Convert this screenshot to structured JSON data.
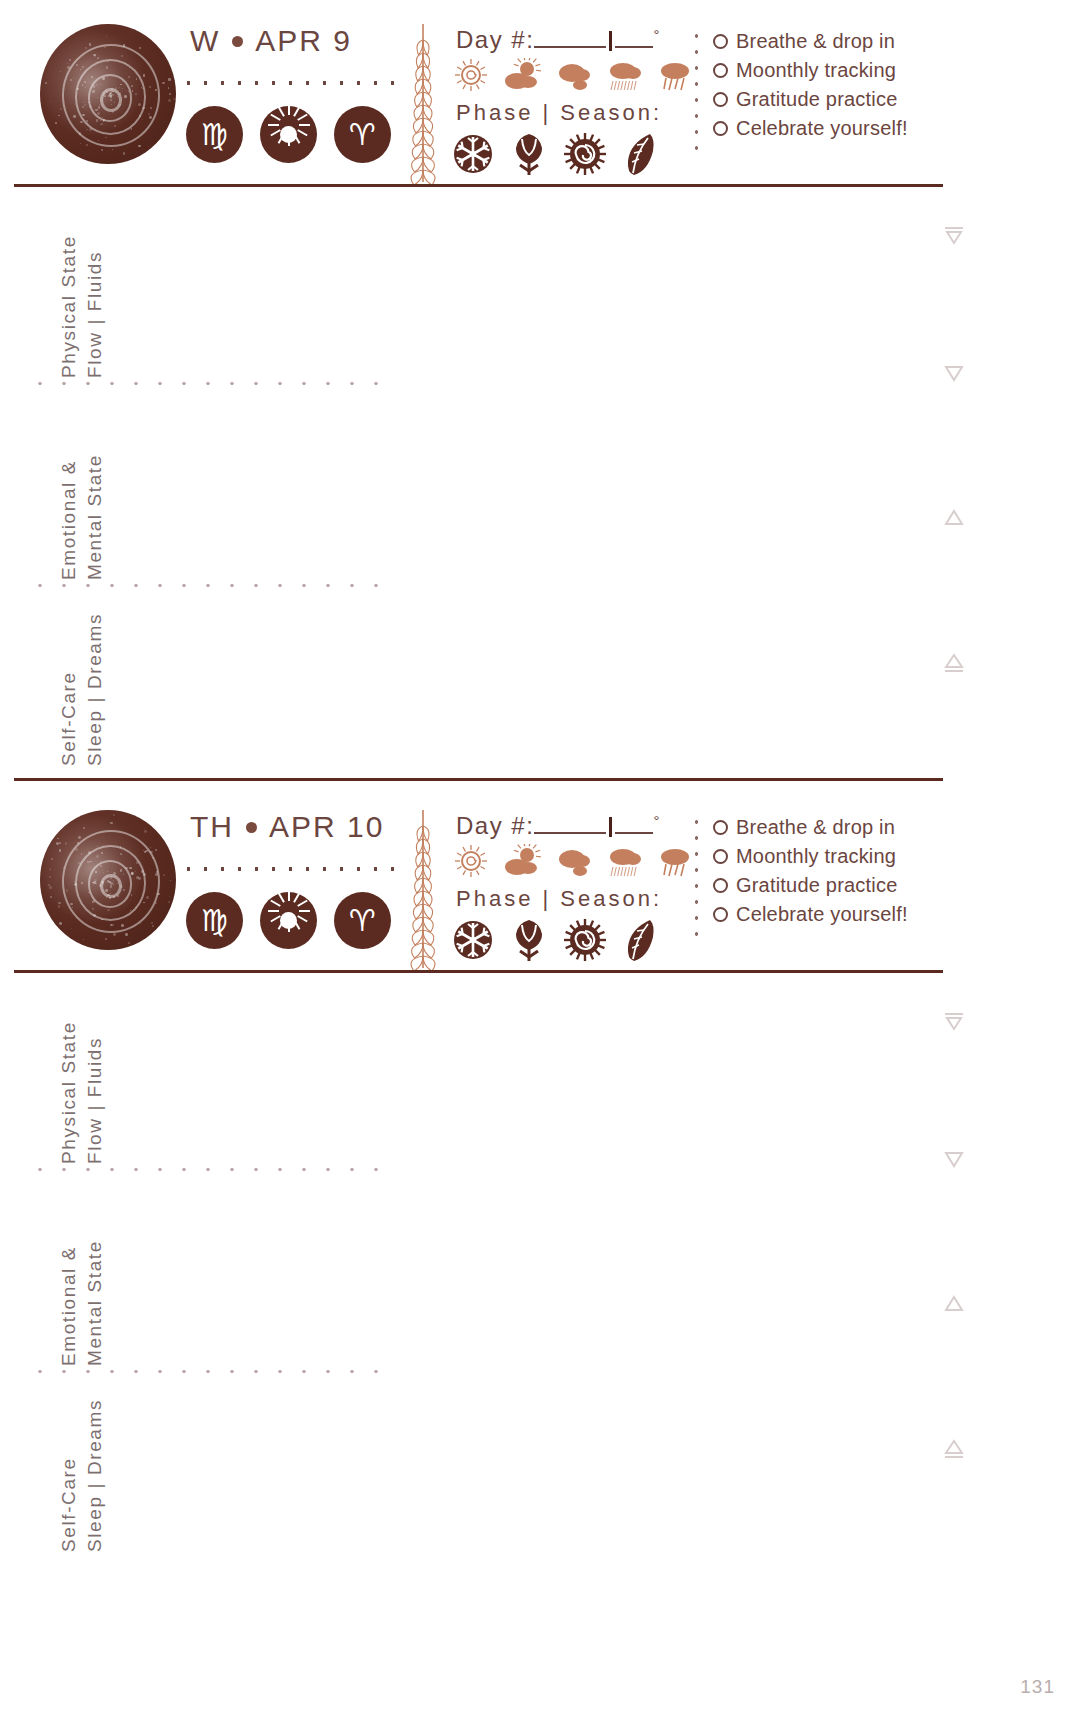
{
  "page": {
    "page_number": "131",
    "accent_dark": "#5b2b21",
    "accent_text": "#6b4540",
    "accent_light": "#c4805e",
    "label_gray": "#7d6f70"
  },
  "days": [
    {
      "weekday": "W",
      "date": "APR 9",
      "moon_icon": "moon-spiral-icon",
      "badges": [
        {
          "name": "zodiac-virgo-badge",
          "glyph": "♍",
          "label": "Virgo"
        },
        {
          "name": "sun-badge",
          "glyph": "",
          "label": "Sun"
        },
        {
          "name": "zodiac-aries-badge",
          "glyph": "♈",
          "label": "Aries"
        }
      ],
      "day_number_label": "Day #:",
      "degree_symbol": "°",
      "phase_season_label": "Phase | Season:",
      "weather_icons": [
        "sun-icon",
        "sun-behind-cloud-icon",
        "cloud-icon",
        "rain-cloud-icon",
        "storm-cloud-icon"
      ],
      "season_icons": [
        "snowflake-winter-icon",
        "tulip-spring-icon",
        "sun-spiral-summer-icon",
        "leaf-autumn-icon"
      ],
      "checklist": [
        "Breathe & drop in",
        "Moonthly tracking",
        "Gratitude practice",
        "Celebrate yourself!"
      ],
      "sections": [
        {
          "line1": "Physical State",
          "line2": "Flow | Fluids",
          "marker": "triangle-down-bar-icon"
        },
        {
          "line1": "Emotional &",
          "line2": "Mental State",
          "marker": "triangle-down-icon"
        },
        {
          "line1": "Self-Care",
          "line2": "Sleep | Dreams",
          "marker": "triangle-up-icon"
        }
      ],
      "extra_markers": [
        "triangle-up-bar-icon"
      ]
    },
    {
      "weekday": "TH",
      "date": "APR 10",
      "moon_icon": "moon-spiral-icon",
      "badges": [
        {
          "name": "zodiac-virgo-badge",
          "glyph": "♍",
          "label": "Virgo"
        },
        {
          "name": "sun-badge",
          "glyph": "",
          "label": "Sun"
        },
        {
          "name": "zodiac-aries-badge",
          "glyph": "♈",
          "label": "Aries"
        }
      ],
      "day_number_label": "Day #:",
      "degree_symbol": "°",
      "phase_season_label": "Phase | Season:",
      "weather_icons": [
        "sun-icon",
        "sun-behind-cloud-icon",
        "cloud-icon",
        "rain-cloud-icon",
        "storm-cloud-icon"
      ],
      "season_icons": [
        "snowflake-winter-icon",
        "tulip-spring-icon",
        "sun-spiral-summer-icon",
        "leaf-autumn-icon"
      ],
      "checklist": [
        "Breathe & drop in",
        "Moonthly tracking",
        "Gratitude practice",
        "Celebrate yourself!"
      ],
      "sections": [
        {
          "line1": "Physical State",
          "line2": "Flow | Fluids",
          "marker": "triangle-down-bar-icon"
        },
        {
          "line1": "Emotional &",
          "line2": "Mental State",
          "marker": "triangle-down-icon"
        },
        {
          "line1": "Self-Care",
          "line2": "Sleep | Dreams",
          "marker": "triangle-up-icon"
        }
      ],
      "extra_markers": [
        "triangle-up-bar-icon"
      ]
    }
  ]
}
